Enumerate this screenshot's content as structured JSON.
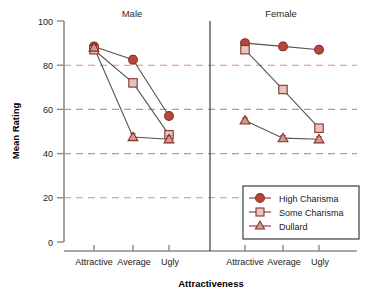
{
  "chart_data": {
    "type": "line",
    "title": "",
    "subtitle": "",
    "xlabel": "Attractiveness",
    "ylabel": "Mean Rating",
    "ylim": [
      0,
      100
    ],
    "yticks": [
      0,
      20,
      40,
      60,
      80,
      100
    ],
    "ytick_labels": [
      "0",
      "20",
      "40",
      "60",
      "80",
      "100"
    ],
    "categories": [
      "Attractive",
      "Average",
      "Ugly"
    ],
    "grid": "horizontal-dashed",
    "grid_color": "#e08c82",
    "legend_position": "inside-bottom-right",
    "panels": [
      {
        "name": "Male",
        "series": [
          {
            "name": "High Charisma",
            "values": [
              88.5,
              82.5,
              57.0
            ],
            "errors": [
              1.5,
              1.8,
              1.2
            ]
          },
          {
            "name": "Some Charisma",
            "values": [
              87.0,
              72.0,
              48.5
            ],
            "errors": [
              1.5,
              1.5,
              1.5
            ]
          },
          {
            "name": "Dullard",
            "values": [
              88.0,
              47.5,
              46.5
            ],
            "errors": [
              1.5,
              1.5,
              1.5
            ]
          }
        ]
      },
      {
        "name": "Female",
        "series": [
          {
            "name": "High Charisma",
            "values": [
              90.0,
              88.5,
              87.0
            ],
            "errors": [
              1.5,
              1.8,
              1.0
            ]
          },
          {
            "name": "Some Charisma",
            "values": [
              87.0,
              69.0,
              51.5
            ],
            "errors": [
              1.5,
              1.5,
              1.5
            ]
          },
          {
            "name": "Dullard",
            "values": [
              55.0,
              47.0,
              46.5
            ],
            "errors": [
              1.2,
              1.2,
              1.2
            ]
          }
        ]
      }
    ],
    "legend": [
      {
        "label": "High Charisma",
        "marker": "circle",
        "fill": "#b5483c",
        "stroke": "#8c2f26"
      },
      {
        "label": "Some Charisma",
        "marker": "square",
        "fill": "#e3c6c2",
        "stroke": "#8c2f26"
      },
      {
        "label": "Dullard",
        "marker": "triangle",
        "fill": "#d09a92",
        "stroke": "#8c2f26"
      }
    ]
  },
  "panel_titles": [
    "Male",
    "Female"
  ],
  "axes": {
    "y_label": "Mean Rating",
    "x_label": "Attractiveness",
    "y_tick_labels": [
      "100",
      "80",
      "60",
      "40",
      "20",
      "0"
    ],
    "x_tick_labels_male": [
      "Attractive",
      "Average",
      "Ugly"
    ],
    "x_tick_labels_female": [
      "Attractive",
      "Average",
      "Ugly"
    ]
  },
  "legend_labels": {
    "high": "High Charisma",
    "some": "Some Charisma",
    "dullard": "Dullard"
  },
  "colors": {
    "circle_fill": "#b5483c",
    "square_fill": "#e3c6c2",
    "triangle_fill": "#d09a92",
    "marker_stroke": "#8c2f26",
    "line": "#555555",
    "gridline": "#e08c82",
    "axis": "#8a8a8a",
    "text": "#1a1a1a"
  }
}
